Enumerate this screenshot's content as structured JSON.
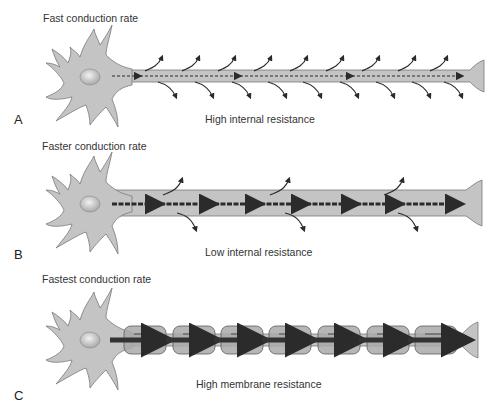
{
  "figure": {
    "panels": [
      {
        "letter": "A",
        "title": "Fast conduction rate",
        "caption": "High internal resistance",
        "axon_type": "thin unmyelinated",
        "leak_arrow_pairs": 9
      },
      {
        "letter": "B",
        "title": "Faster conduction rate",
        "caption": "Low internal resistance",
        "axon_type": "thick unmyelinated",
        "leak_arrow_pairs": 3
      },
      {
        "letter": "C",
        "title": "Fastest conduction rate",
        "caption": "High membrane resistance",
        "axon_type": "myelinated",
        "myelin_segments": 7
      }
    ],
    "colors": {
      "cell_fill": "#c4c4c4",
      "cell_stroke": "#7a7a7a",
      "myelin_fill": "#a9a9a9",
      "arrow": "#2b2b2b",
      "text": "#333333"
    }
  }
}
